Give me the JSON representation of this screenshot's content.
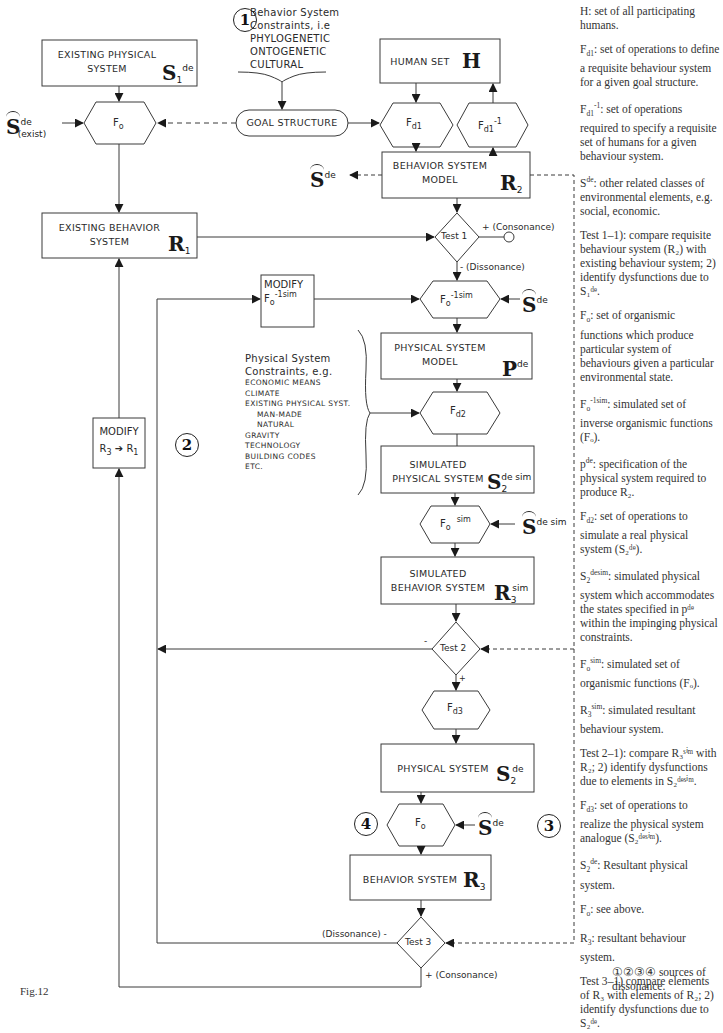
{
  "figure": {
    "label": "Fig.12"
  },
  "source_numbers": {
    "one": "1",
    "two": "2",
    "three": "3",
    "four": "4"
  },
  "behavior_constraints": {
    "lines": [
      "Behavior System",
      "Constraints, i.e",
      "PHYLOGENETIC",
      "ONTOGENETIC",
      "CULTURAL"
    ]
  },
  "physical_constraints": {
    "heading": [
      "Physical System",
      "Constraints, e.g."
    ],
    "items": [
      "ECONOMIC MEANS",
      "CLIMATE",
      "EXISTING PHYSICAL SYST.",
      "MAN-MADE",
      "NATURAL",
      "GRAVITY",
      "TECHNOLOGY",
      "BUILDING CODES",
      "ETC."
    ]
  },
  "nodes": {
    "existing_physical": {
      "line1": "EXISTING PHYSICAL",
      "line2": "SYSTEM",
      "symbol": "S",
      "sub": "1",
      "sup": "de"
    },
    "fo_top": {
      "label": "F",
      "sub": "o"
    },
    "s_exist": {
      "symbol": "S",
      "sup": "de",
      "sub": "(exist)"
    },
    "goal_structure": {
      "label": "GOAL STRUCTURE"
    },
    "human_set": {
      "label": "HUMAN SET",
      "symbol": "H"
    },
    "fd1": {
      "label": "F",
      "sub": "d1"
    },
    "fd1_inv": {
      "label": "F",
      "sub": "d1",
      "sup": "-1"
    },
    "s_de_left": {
      "symbol": "S",
      "sup": "de"
    },
    "behavior_model": {
      "line1": "BEHAVIOR SYSTEM",
      "line2": "MODEL",
      "symbol": "R",
      "sub": "2"
    },
    "existing_behavior": {
      "line1": "EXISTING BEHAVIOR",
      "line2": "SYSTEM",
      "symbol": "R",
      "sub": "1"
    },
    "test1": {
      "label": "Test 1",
      "plus": "+ (Consonance)",
      "minus": "- (Dissonance)"
    },
    "modify_fo": {
      "line1": "MODIFY",
      "label": "F",
      "sub": "o",
      "sup": "-1sim"
    },
    "fo_inv_sim": {
      "label": "F",
      "sub": "o",
      "sup": "-1sim"
    },
    "s_de_right1": {
      "symbol": "S",
      "sup": "de"
    },
    "physical_model": {
      "line1": "PHYSICAL SYSTEM",
      "line2": "MODEL",
      "symbol": "P",
      "sup": "de"
    },
    "modify_r3": {
      "line1": "MODIFY",
      "line2a": "R",
      "sub_a": "3",
      "line2b": "R",
      "sub_b": "1"
    },
    "fd2": {
      "label": "F",
      "sub": "d2"
    },
    "sim_physical": {
      "line1": "SIMULATED",
      "line2": "PHYSICAL SYSTEM",
      "symbol": "S",
      "sub": "2",
      "sup": "de sim"
    },
    "fo_sim": {
      "label": "F",
      "sub": "o",
      "sup": "sim"
    },
    "s_de_sim": {
      "symbol": "S",
      "sup": "de sim"
    },
    "sim_behavior": {
      "line1": "SIMULATED",
      "line2": "BEHAVIOR SYSTEM",
      "symbol": "R",
      "sub": "3",
      "sup": "sim"
    },
    "test2": {
      "label": "Test 2",
      "minus": "-",
      "plus": "+"
    },
    "fd3": {
      "label": "F",
      "sub": "d3"
    },
    "physical_system": {
      "label": "PHYSICAL SYSTEM",
      "symbol": "S",
      "sub": "2",
      "sup": "de"
    },
    "fo_bottom": {
      "label": "F",
      "sub": "o"
    },
    "s_de_right2": {
      "symbol": "S",
      "sup": "de"
    },
    "behavior_system": {
      "label": "BEHAVIOR SYSTEM",
      "symbol": "R",
      "sub": "3"
    },
    "test3": {
      "label": "Test 3",
      "minus": "(Dissonance)  -",
      "plus": "+ (Consonance)"
    }
  },
  "glossary": [
    {
      "term": "H",
      "text": ": set of all participating humans."
    },
    {
      "term": "F",
      "term_sub": "d1",
      "text": ": set of operations to define a requisite behaviour system for a given goal structure."
    },
    {
      "term": "F",
      "term_sub": "d1",
      "term_sup": "-1",
      "text": ": set of operations required to specify a requisite set of humans for a given behaviour system."
    },
    {
      "term": "S",
      "term_sup": "de",
      "text": ": other related classes of environmental elements, e.g. social, economic."
    },
    {
      "term": "Test 1",
      "text": "–1): compare requisite behaviour system (R₂) with existing behaviour system; 2) identify dysfunctions due to S₁ᵈᵉ."
    },
    {
      "term": "F",
      "term_sub": "o",
      "text": ": set of organismic functions which produce particular system of behaviours given a particular environmental state."
    },
    {
      "term": "F",
      "term_sub": "o",
      "term_sup": "-1sim",
      "text": ": simulated set of inverse organismic functions (Fₒ)."
    },
    {
      "term": "p",
      "term_sup": "de",
      "text": ": specification of the physical system required to produce R₂."
    },
    {
      "term": "F",
      "term_sub": "d2",
      "text": ": set of operations to simulate a real physical system (S₂ᵈᵉ)."
    },
    {
      "term": "S",
      "term_sub": "2",
      "term_sup": "desim",
      "text": ": simulated physical system which accommodates the states specified in pᵈᵉ within the impinging physical constraints."
    },
    {
      "term": "F",
      "term_sub": "o",
      "term_sup": "sim",
      "text": ": simulated set of organismic functions (Fₒ)."
    },
    {
      "term": "R",
      "term_sub": "3",
      "term_sup": "sim",
      "text": ": simulated resultant behaviour system."
    },
    {
      "term": "Test 2",
      "text": "–1): compare R₃ˢⁱᵐ with R₂; 2) identify dysfunctions due to elements in S₂ᵈᵉˢⁱᵐ."
    },
    {
      "term": "F",
      "term_sub": "d3",
      "text": ": set of operations to realize the physical system analogue (S₂ᵈᵉˢⁱᵐ)."
    },
    {
      "term": "S",
      "term_sub": "2",
      "term_sup": "de",
      "text": ": Resultant physical system."
    },
    {
      "term": "F",
      "term_sub": "o",
      "text": ": see above."
    },
    {
      "term": "R",
      "term_sub": "3",
      "text": ": resultant behaviour system."
    },
    {
      "term": "Test 3",
      "text": "–1) compare elements of R₃ with elements of R₂; 2) identify dysfunctions due to S₂ᵈᵉ."
    }
  ],
  "legend": {
    "symbols": "①②③④",
    "text": " sources of dissonance."
  }
}
